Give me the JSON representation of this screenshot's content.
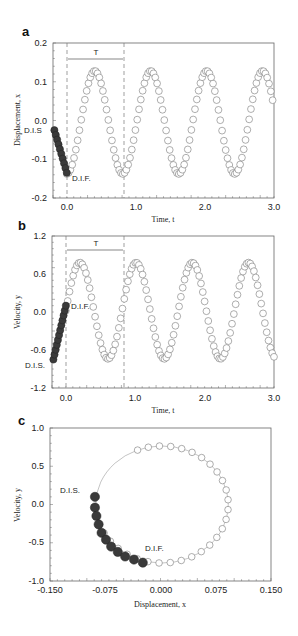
{
  "figure": {
    "panels": [
      {
        "letter": "a",
        "ylabel": "Displacement, x",
        "xlabel": "",
        "annot_T": "T",
        "annot_start": "D.I.S",
        "annot_end": "D.I.F."
      },
      {
        "letter": "b",
        "ylabel": "Velocity, y",
        "xlabel": "Time, t",
        "annot_T": "T",
        "annot_start": "D.I.S.",
        "annot_end": "D.I.F."
      },
      {
        "letter": "c",
        "ylabel": "Velocity, y",
        "xlabel": "Displacement, x",
        "annot_start": "D.I.S.",
        "annot_end": "D.I.F."
      }
    ],
    "panel_a_xlabel_shared": "Time, t"
  },
  "chart_data": [
    {
      "type": "scatter",
      "panel": "a",
      "title": "",
      "xlabel": "Time, t",
      "ylabel": "Displacement, x",
      "xlim": [
        -0.2,
        3.0
      ],
      "ylim": [
        -0.2,
        0.2
      ],
      "xticks": [
        "0.0",
        "1.0",
        "2.0",
        "3.0"
      ],
      "yticks": [
        "-0.2",
        "-0.1",
        "0.0",
        "0.1",
        "0.2"
      ],
      "grid": false,
      "annotations": {
        "period_label": "T",
        "period_start": 0.0,
        "period_end": 0.83,
        "start_label": "D.I.S",
        "end_label": "D.I.F."
      },
      "series": [
        {
          "name": "delayed initial history (filled)",
          "t_start": -0.18,
          "t_end": 0.0,
          "count": 10
        },
        {
          "name": "solution (open)",
          "t_start": 0.0,
          "t_end": 2.98,
          "count": 115
        }
      ],
      "model": {
        "offset": -0.005,
        "amplitude": 0.133,
        "period": 0.81,
        "phase_form": "x = offset - amplitude*cos(2*pi*t/period)"
      },
      "approx_extrema": {
        "max": 0.13,
        "min": -0.14
      }
    },
    {
      "type": "scatter",
      "panel": "b",
      "title": "",
      "xlabel": "Time, t",
      "ylabel": "Velocity, y",
      "xlim": [
        -0.2,
        3.0
      ],
      "ylim": [
        -1.2,
        1.2
      ],
      "xticks": [
        "0.0",
        "1.0",
        "2.0",
        "3.0"
      ],
      "yticks": [
        "-1.2",
        "-0.6",
        "0.0",
        "0.6",
        "1.2"
      ],
      "grid": false,
      "annotations": {
        "period_label": "T",
        "period_start": 0.0,
        "period_end": 0.83,
        "start_label": "D.I.S.",
        "end_label": "D.I.F."
      },
      "series": [
        {
          "name": "delayed initial history (filled)",
          "t_start": -0.18,
          "t_end": 0.0,
          "y_start": -0.75,
          "y_end": 0.1,
          "count": 12
        },
        {
          "name": "solution (open)",
          "t_start": 0.0,
          "t_end": 3.0,
          "count": 115
        }
      ],
      "model": {
        "amplitude": 0.76,
        "period": 0.81,
        "phase_t0": 0.0
      },
      "approx_extrema": {
        "max": 0.78,
        "min": -0.78
      }
    },
    {
      "type": "scatter",
      "panel": "c",
      "title": "",
      "xlabel": "Displacement, x",
      "ylabel": "Velocity, y",
      "xlim": [
        -0.15,
        0.15
      ],
      "ylim": [
        -1.0,
        1.0
      ],
      "xticks": [
        "-0.150",
        "-0.075",
        "0.000",
        "0.075",
        "0.150"
      ],
      "yticks": [
        "-1.0",
        "-0.5",
        "0.0",
        "0.5",
        "1.0"
      ],
      "grid": false,
      "annotations": {
        "start_label": "D.I.S.",
        "end_label": "D.I.F."
      },
      "limit_cycle": {
        "center_x": 0.002,
        "center_y": 0.0,
        "radius_x": 0.09,
        "radius_y": 0.765,
        "open_count": 30
      },
      "filled_points": [
        [
          -0.089,
          0.1
        ],
        [
          -0.089,
          -0.04
        ],
        [
          -0.087,
          -0.15
        ],
        [
          -0.084,
          -0.26
        ],
        [
          -0.08,
          -0.37
        ],
        [
          -0.074,
          -0.46
        ],
        [
          -0.067,
          -0.55
        ],
        [
          -0.058,
          -0.62
        ],
        [
          -0.048,
          -0.68
        ],
        [
          -0.036,
          -0.72
        ],
        [
          -0.024,
          -0.76
        ]
      ]
    }
  ]
}
